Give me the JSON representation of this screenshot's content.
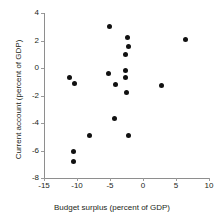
{
  "chart_data": {
    "type": "scatter",
    "title": "",
    "xlabel": "Budget surplus (percent of GDP)",
    "ylabel": "Current account (percent of GDP)",
    "xlim": [
      -15,
      10
    ],
    "ylim": [
      -8,
      4
    ],
    "xticks": [
      "-15",
      "-10",
      "-5",
      "0",
      "5",
      "10"
    ],
    "yticks": [
      "4",
      "2",
      "0",
      "-2",
      "-4",
      "-6",
      "-8"
    ],
    "xtick_values": [
      -15,
      -10,
      -5,
      0,
      5,
      10
    ],
    "ytick_values": [
      4,
      2,
      0,
      -2,
      -4,
      -6,
      -8
    ],
    "grid": false,
    "legend": false,
    "marker": "filled-circle",
    "marker_color": "#111111",
    "axis_color": "#8e8e8e",
    "points": [
      {
        "x": -11.1,
        "y": -0.7
      },
      {
        "x": -10.4,
        "y": -1.1
      },
      {
        "x": -10.5,
        "y": -6.1
      },
      {
        "x": -10.6,
        "y": -6.8
      },
      {
        "x": -8.1,
        "y": -4.9
      },
      {
        "x": -5.1,
        "y": 3.0
      },
      {
        "x": -5.2,
        "y": -0.4
      },
      {
        "x": -4.2,
        "y": -1.2
      },
      {
        "x": -4.3,
        "y": -3.7
      },
      {
        "x": -2.3,
        "y": 2.2
      },
      {
        "x": -2.2,
        "y": 1.6
      },
      {
        "x": -2.7,
        "y": 1.0
      },
      {
        "x": -2.7,
        "y": -0.2
      },
      {
        "x": -2.6,
        "y": -0.7
      },
      {
        "x": -2.5,
        "y": -1.8
      },
      {
        "x": -2.2,
        "y": -4.9
      },
      {
        "x": 2.8,
        "y": -1.3
      },
      {
        "x": 6.5,
        "y": 2.1
      }
    ]
  }
}
